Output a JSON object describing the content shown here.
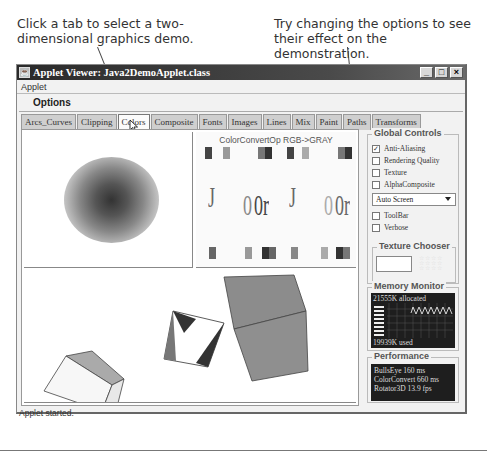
{
  "callouts": {
    "left": "Click a tab to select a two-dimensional graphics demo.",
    "right": "Try changing the options to see their effect on the demonstration."
  },
  "window": {
    "title": "Applet Viewer: Java2DemoApplet.class",
    "icon": "java-cup-icon",
    "buttons": {
      "minimize": "_",
      "maximize": "□",
      "close": "×"
    }
  },
  "menubar": {
    "items": [
      "Applet"
    ]
  },
  "options_label": "Options",
  "tabs": [
    {
      "label": "Arcs_Curves",
      "active": false
    },
    {
      "label": "Clipping",
      "active": false
    },
    {
      "label": "Colors",
      "active": true
    },
    {
      "label": "Composite",
      "active": false
    },
    {
      "label": "Fonts",
      "active": false
    },
    {
      "label": "Images",
      "active": false
    },
    {
      "label": "Lines",
      "active": false
    },
    {
      "label": "Mix",
      "active": false
    },
    {
      "label": "Paint",
      "active": false
    },
    {
      "label": "Paths",
      "active": false
    },
    {
      "label": "Transforms",
      "active": false
    }
  ],
  "demo": {
    "top_left": "BullsEye",
    "top_right_title": "ColorConvertOp RGB->GRAY",
    "top_right_glyphs": [
      "J",
      "0",
      "0r",
      "J",
      "0",
      "0r"
    ],
    "bottom": "Rotator3D"
  },
  "global_controls": {
    "title": "Global Controls",
    "checkboxes": [
      {
        "label": "Anti-Aliasing",
        "checked": true
      },
      {
        "label": "Rendering Quality",
        "checked": false
      },
      {
        "label": "Texture",
        "checked": false
      },
      {
        "label": "AlphaComposite",
        "checked": false
      }
    ],
    "screen_select": {
      "value": "Auto Screen"
    },
    "checkboxes2": [
      {
        "label": "ToolBar",
        "checked": false
      },
      {
        "label": "Verbose",
        "checked": false
      }
    ],
    "texture_chooser": {
      "title": "Texture Chooser"
    }
  },
  "memory_monitor": {
    "title": "Memory Monitor",
    "allocated": "21555K allocated",
    "used": "19939K used"
  },
  "performance": {
    "title": "Performance",
    "lines": [
      "BullsEye 160 ms",
      "ColorConvert 660 ms",
      "Rotator3D 13.9 fps"
    ]
  },
  "status": "Applet started."
}
